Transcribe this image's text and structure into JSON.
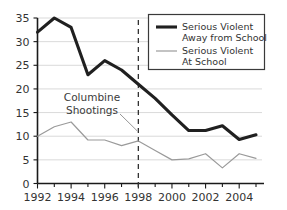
{
  "chart_data": {
    "type": "line",
    "title": "",
    "subtitle": "",
    "xlabel": "",
    "ylabel": "",
    "x": [
      1992,
      1993,
      1994,
      1995,
      1996,
      1997,
      1998,
      1999,
      2000,
      2001,
      2002,
      2003,
      2004,
      2005
    ],
    "xlim": [
      1992,
      2005
    ],
    "ylim": [
      0,
      35
    ],
    "grid": true,
    "legend_position": "top-right",
    "series": [
      {
        "name": "Serious Violent Away from School",
        "color": "#202020",
        "style": "thick",
        "values": [
          32,
          35,
          33,
          23,
          26,
          24,
          21,
          18,
          14.5,
          11.2,
          11.2,
          12.2,
          9.3,
          10.3
        ]
      },
      {
        "name": "Serious Violent At School",
        "color": "#9a9a9a",
        "style": "thin",
        "values": [
          10,
          12,
          13,
          9.2,
          9.2,
          8,
          9,
          7,
          5,
          5.2,
          6.3,
          3.3,
          6.3,
          5.3
        ]
      }
    ],
    "ytick_labels": [
      "0",
      "5",
      "10",
      "15",
      "20",
      "25",
      "30",
      "35"
    ],
    "ytick_values": [
      0,
      5,
      10,
      15,
      20,
      25,
      30,
      35
    ],
    "xtick_labels": [
      "1992",
      "1994",
      "1996",
      "1998",
      "2000",
      "2002",
      "2004"
    ],
    "xtick_values": [
      1992,
      1994,
      1996,
      1998,
      2000,
      2002,
      2004
    ],
    "xtick_minor_values": [
      1993,
      1995,
      1997,
      1999,
      2001,
      2003,
      2005
    ],
    "annotations": [
      {
        "name": "columbine-shootings",
        "line1": "Columbine",
        "line2": "Shootings",
        "target_x": 1998,
        "event_line_color": "#333333"
      }
    ]
  },
  "legend": {
    "items": [
      {
        "label_line1": "Serious Violent",
        "label_line2": "Away from School"
      },
      {
        "label_line1": "Serious Violent",
        "label_line2": "At School"
      }
    ]
  }
}
